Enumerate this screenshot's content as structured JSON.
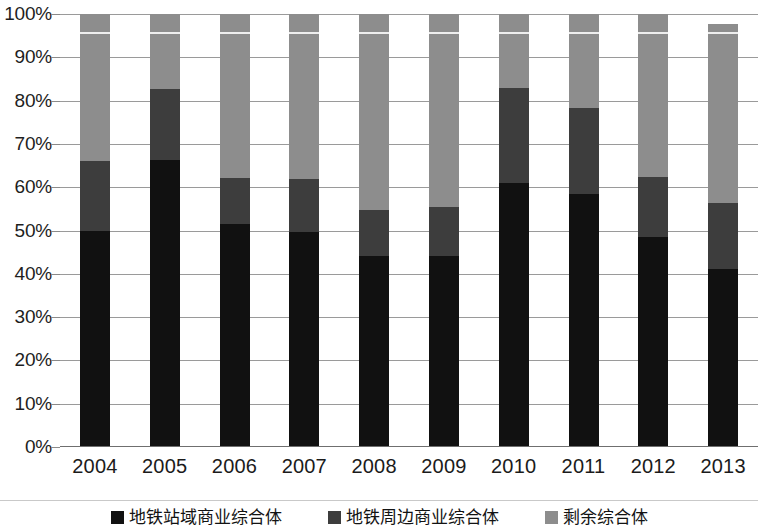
{
  "chart_data": {
    "type": "bar",
    "title": "",
    "subtitle": "",
    "xlabel": "",
    "ylabel": "",
    "stacked": true,
    "stack_mode": "percent",
    "ylim": [
      0,
      100
    ],
    "grid": true,
    "legend_position": "bottom",
    "categories": [
      "2004",
      "2005",
      "2006",
      "2007",
      "2008",
      "2009",
      "2010",
      "2011",
      "2012",
      "2013"
    ],
    "ytick_labels": [
      "0%",
      "10%",
      "20%",
      "30%",
      "40%",
      "50%",
      "60%",
      "70%",
      "80%",
      "90%",
      "100%"
    ],
    "ytick_values": [
      0,
      10,
      20,
      30,
      40,
      50,
      60,
      70,
      80,
      90,
      100
    ],
    "series": [
      {
        "name": "地铁站域商业综合体",
        "color": "#111111",
        "values": [
          50.0,
          66.3,
          51.5,
          49.6,
          44.0,
          44.0,
          61.0,
          58.5,
          48.5,
          41.0
        ]
      },
      {
        "name": "地铁周边商业综合体",
        "color": "#3d3d3d",
        "values": [
          16.0,
          16.4,
          10.6,
          12.3,
          10.7,
          11.4,
          22.0,
          19.8,
          13.9,
          15.4
        ]
      },
      {
        "name": "剩余综合体",
        "color": "#8d8d8d",
        "values": [
          34.0,
          17.3,
          37.9,
          38.1,
          45.3,
          44.6,
          17.0,
          21.7,
          37.6,
          41.3
        ]
      }
    ],
    "bar_totals": [
      100,
      100,
      100,
      100,
      100,
      100,
      100,
      100,
      100,
      97.7
    ]
  },
  "legend": {
    "items": [
      {
        "label": "地铁站域商业综合体",
        "color": "#111111"
      },
      {
        "label": "地铁周边商业综合体",
        "color": "#3d3d3d"
      },
      {
        "label": "剩余综合体",
        "color": "#8d8d8d"
      }
    ]
  }
}
